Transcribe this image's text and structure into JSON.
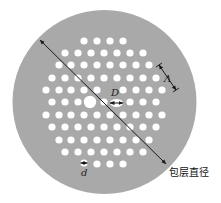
{
  "diagram": {
    "type": "photonic-crystal-fiber-cross-section",
    "colors": {
      "page_background": "#ffffff",
      "cladding": "#a9a9a9",
      "hole": "#ffffff",
      "annotation": "#1a1a1a"
    },
    "cladding_disc": {
      "cx": 104.5,
      "cy": 102,
      "r": 92
    },
    "hole_radius": 3.6,
    "core": {
      "cx": 90,
      "cy": 102,
      "r": 6.2
    },
    "hole_rows": [
      {
        "y": 41,
        "xs": [
          84,
          97,
          110,
          123
        ]
      },
      {
        "y": 53,
        "xs": [
          65,
          78,
          91,
          104,
          117,
          130,
          143
        ]
      },
      {
        "y": 65,
        "xs": [
          59,
          71,
          84,
          97,
          110,
          123,
          136,
          149
        ]
      },
      {
        "y": 78,
        "xs": [
          52,
          65,
          78,
          91,
          104,
          117,
          130,
          143,
          156
        ]
      },
      {
        "y": 90,
        "xs": [
          46,
          59,
          71,
          84,
          97,
          123,
          136,
          149,
          162
        ]
      },
      {
        "y": 102,
        "xs": [
          52,
          65,
          78,
          104,
          130,
          143,
          156
        ]
      },
      {
        "y": 115,
        "xs": [
          46,
          59,
          71,
          84,
          97,
          110,
          123,
          136,
          149,
          162
        ]
      },
      {
        "y": 127,
        "xs": [
          52,
          65,
          78,
          91,
          104,
          117,
          130,
          143,
          156
        ]
      },
      {
        "y": 140,
        "xs": [
          59,
          71,
          84,
          97,
          110,
          123,
          136,
          149
        ]
      },
      {
        "y": 152,
        "xs": [
          65,
          78,
          91,
          104,
          117,
          130,
          143
        ]
      },
      {
        "y": 164,
        "xs": [
          97,
          110,
          123
        ]
      }
    ],
    "annotations": {
      "core_diameter": {
        "label": "D",
        "label_x": 111,
        "label_y": 96,
        "arrow_x1": 110,
        "arrow_x2": 123,
        "arrow_y": 103
      },
      "hole_diameter": {
        "label": "d",
        "label_x": 81,
        "label_y": 176,
        "hole_cx": 84,
        "hole_cy": 163,
        "arrow_x1": 80.5,
        "arrow_x2": 87.5,
        "arrow_y": 163
      },
      "pitch": {
        "label": "Λ",
        "label_x": 164,
        "label_y": 82,
        "x1": 159,
        "y1": 65,
        "x2": 176,
        "y2": 90
      },
      "cladding_diameter": {
        "label": "包层直径",
        "label_x": 169,
        "label_y": 176,
        "x1": 40,
        "y1": 40,
        "x2": 166,
        "y2": 164
      }
    }
  }
}
